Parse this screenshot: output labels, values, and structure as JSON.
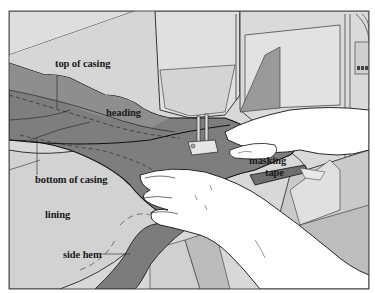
{
  "figure": {
    "colors": {
      "background": "#ffffff",
      "frame": "#4a4a4a",
      "machine": "#dcdcdc",
      "machine_shadow": "#b8b8b8",
      "fabric_dark": "#7a7a7a",
      "fabric_heading": "#8a8a8a",
      "lining": "#d4d4d4",
      "table": "#c8c8c8",
      "skin": "#ffffff",
      "ink": "#1a1a1a"
    },
    "labels": {
      "top_of_casing": "top of casing",
      "heading": "heading",
      "bottom_of_casing": "bottom of casing",
      "lining": "lining",
      "side_hem": "side hem",
      "masking_tape_line1": "masking",
      "masking_tape_line2": "tape"
    }
  }
}
